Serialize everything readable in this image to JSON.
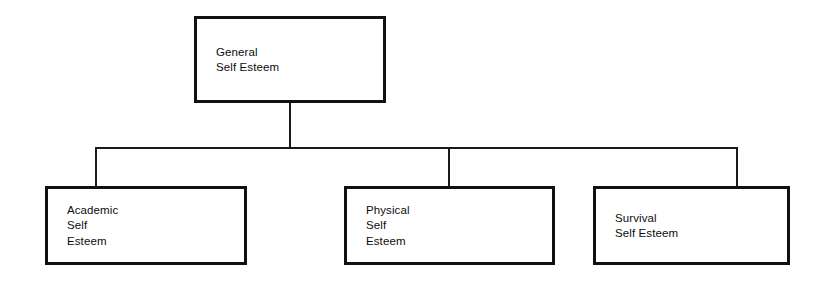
{
  "diagram": {
    "type": "organizational-tree",
    "background_color": "#ffffff",
    "line_color": "#1a1a1a",
    "text_color": "#0d0d0d",
    "root": {
      "id": "general-self-esteem",
      "label": "General\nSelf Esteem",
      "lines": [
        "General",
        "Self Esteem"
      ],
      "x": 194,
      "y": 16,
      "width": 192,
      "height": 87
    },
    "children": [
      {
        "id": "academic-self-esteem",
        "label": "Academic\nSelf\nEsteem",
        "lines": [
          "Academic",
          "Self",
          "Esteem"
        ],
        "x": 45,
        "y": 186,
        "width": 202,
        "height": 79
      },
      {
        "id": "physical-self-esteem",
        "label": "Physical\nSelf\nEsteem",
        "lines": [
          "Physical",
          "Self",
          "Esteem"
        ],
        "x": 344,
        "y": 186,
        "width": 211,
        "height": 79
      },
      {
        "id": "survival-self-esteem",
        "label": "Survival\nSelf Esteem",
        "lines": [
          "Survival",
          "Self Esteem"
        ],
        "x": 593,
        "y": 186,
        "width": 197,
        "height": 79
      }
    ],
    "connectors": {
      "stem": {
        "x": 289,
        "y_top": 103,
        "y_bottom": 149
      },
      "bus": {
        "y": 147,
        "x_left": 95,
        "x_right": 737
      },
      "drops": [
        {
          "x": 95,
          "y_top": 147,
          "y_bottom": 187
        },
        {
          "x": 448,
          "y_top": 147,
          "y_bottom": 187
        },
        {
          "x": 736,
          "y_top": 147,
          "y_bottom": 187
        }
      ]
    }
  }
}
